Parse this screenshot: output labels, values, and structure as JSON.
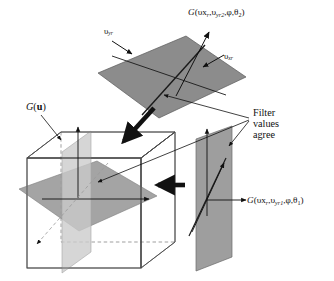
{
  "figure": {
    "type": "technical-diagram",
    "background_color": "#ffffff",
    "line_color": "#111111"
  },
  "labels": {
    "top_plane_label": "G(υx_r,υ_yr2,φ,θ_2)",
    "top_plane_parts": {
      "fn": "G",
      "open": "(",
      "arg1_main": "υx",
      "arg1_sub": "r",
      "comma1": ",",
      "arg2_main": "υ",
      "arg2_sub": "yr2",
      "comma2": ",",
      "arg3": "φ",
      "comma3": ",",
      "arg4_main": "θ",
      "arg4_sub": "2",
      "close": ")"
    },
    "right_plane_label": "G(υx_r,υ_yr1,φ,θ_1)",
    "right_plane_parts": {
      "fn": "G",
      "open": "(",
      "arg1_main": "υx",
      "arg1_sub": "r",
      "comma1": ",",
      "arg2_main": "υ",
      "arg2_sub": "yr1",
      "comma2": ",",
      "arg3": "φ",
      "comma3": ",",
      "arg4_main": "θ",
      "arg4_sub": "1",
      "close": ")"
    },
    "cube_label": "G(u)",
    "cube_label_parts": {
      "fn": "G",
      "open": "(",
      "arg": "u",
      "close": ")"
    },
    "axis_yr": "υyr",
    "axis_yr_parts": {
      "main": "υ",
      "sub": "yr"
    },
    "axis_xr": "υxr",
    "axis_xr_parts": {
      "main": "υ",
      "sub": "xr"
    },
    "annotation_line1": "Filter",
    "annotation_line2": "values",
    "annotation_line3": "agree"
  },
  "colors": {
    "top_plane_fill": "#8c8c8c",
    "cube_horizontal_plane_fill": "#9c9c9c",
    "cube_vertical_plane_fill": "#c8c8c8",
    "right_plane_fill": "#9e9e9e",
    "cube_edge": "#4a4a4a",
    "cube_hidden_edge": "#8a8a8a",
    "arrow_black": "#111111",
    "text": "#111111"
  },
  "shapes": {
    "top_plane_points": "98,73 186,36 246,77 159,118",
    "cube_front_face": "27,158 141,158 141,268 27,268",
    "cube_top_back_offset": {
      "dx": 34,
      "dy": -34
    },
    "right_plane_points": "196,139 232,127 232,258 196,270",
    "cube_horizontal_plane_points": "19,189 97,161 157,196 79,231",
    "cube_vertical_plane_points": "62,153 91,133 91,254 62,272"
  },
  "arrows": {
    "thick_into_cube": {
      "from": "152,110",
      "to": "122,143"
    },
    "thick_between": {
      "from": "183,185",
      "to": "157,185"
    },
    "cube_axis_up": {
      "from": "78,195",
      "to": "78,126"
    },
    "cube_axis_right": {
      "from": "45,200",
      "to": "148,200"
    },
    "cube_axis_diagonal": {
      "from": "105,165",
      "to": "38,243"
    },
    "right_axis_up": {
      "from": "207,215",
      "to": "207,128"
    },
    "right_axis_right": {
      "from": "207,200",
      "to": "245,200"
    },
    "axis_yr_arrow": {
      "from": "113,42",
      "to": "131,53"
    },
    "axis_xr_arrow": {
      "from": "222,56",
      "to": "204,67"
    },
    "top_plane_normal": {
      "from": "176,96",
      "to": "208,33"
    },
    "callout_to_top_plane": {
      "from": "248,120",
      "to": "162,96"
    },
    "callout_to_cube": {
      "from": "248,120",
      "to": "96,183"
    },
    "callout_to_right_plane": {
      "from": "248,120",
      "to": "228,145"
    },
    "label_to_cube": {
      "from": "42,116",
      "to": "62,139"
    },
    "right_plane_diagonal_arrow": {
      "from": "190,235",
      "to": "222,165"
    }
  }
}
